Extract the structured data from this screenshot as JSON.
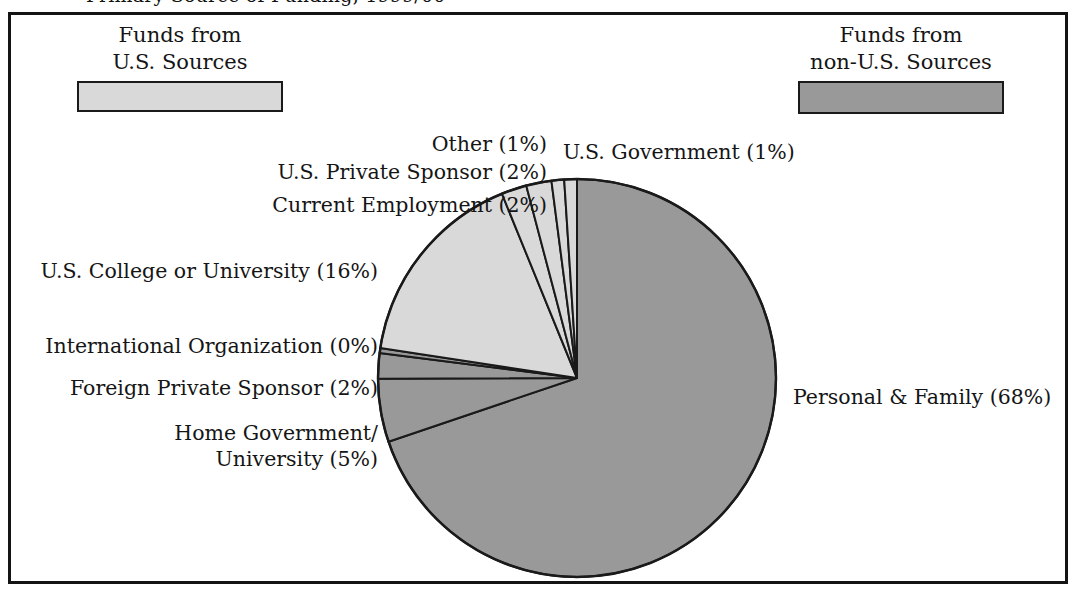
{
  "title_fragment": "Primary Source of Funding, 1999/00",
  "frame": {
    "border_color": "#141414"
  },
  "legend": {
    "us": {
      "line1": "Funds from",
      "line2": "U.S. Sources",
      "swatch_name": "us-sources-swatch",
      "color": "#d9d9d9"
    },
    "non_us": {
      "line1": "Funds from",
      "line2": "non-U.S. Sources",
      "swatch_name": "non-us-sources-swatch",
      "color": "#999999"
    }
  },
  "labels": {
    "other": "Other (1%)",
    "us_government": "U.S. Government (1%)",
    "us_private_sponsor": "U.S. Private Sponsor (2%)",
    "current_employment": "Current Employment (2%)",
    "us_college": "U.S. College or University (16%)",
    "international_org": "International Organization (0%)",
    "foreign_private_sponsor": "Foreign Private Sponsor (2%)",
    "home_government_line1": "Home Government/",
    "home_government_line2": "University (5%)",
    "personal_family": "Personal & Family (68%)"
  },
  "chart_data": {
    "type": "pie",
    "title": "Primary Source of Funding",
    "xlabel": "",
    "ylabel": "",
    "start_angle_deg": 0,
    "direction": "clockwise",
    "center": {
      "x": 577,
      "y": 378
    },
    "radius": 199,
    "legend_position": "top",
    "grid": false,
    "categories": [
      "Personal & Family",
      "Home Government/University",
      "Foreign Private Sponsor",
      "International Organization",
      "U.S. College or University",
      "Current Employment",
      "U.S. Private Sponsor",
      "Other",
      "U.S. Government"
    ],
    "values": [
      68,
      5,
      2,
      0.4,
      16,
      2,
      2,
      1,
      1
    ],
    "labels": [
      "Personal & Family (68%)",
      "Home Government/ University (5%)",
      "Foreign Private Sponsor (2%)",
      "International Organization (0%)",
      "U.S. College or University (16%)",
      "Current Employment (2%)",
      "U.S. Private Sponsor (2%)",
      "Other (1%)",
      "U.S. Government (1%)"
    ],
    "slice_colors": [
      "#999999",
      "#999999",
      "#999999",
      "#999999",
      "#d9d9d9",
      "#d9d9d9",
      "#d9d9d9",
      "#d9d9d9",
      "#d9d9d9"
    ],
    "groups": [
      {
        "name": "Funds from non-U.S. Sources",
        "color": "#999999"
      },
      {
        "name": "Funds from U.S. Sources",
        "color": "#d9d9d9"
      }
    ],
    "slice_edge_color": "#1a1a1a"
  }
}
